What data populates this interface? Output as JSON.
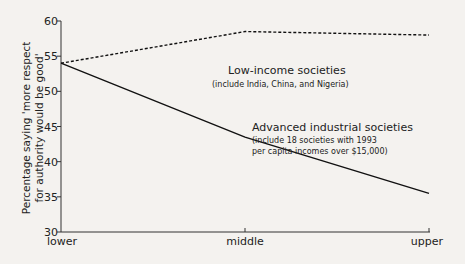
{
  "chart_data": {
    "type": "line",
    "title": "",
    "xlabel": "",
    "ylabel": "Percentage saying 'more respect for authority would be good'",
    "ylabel_lines": [
      "Percentage saying 'more respect",
      "for authority would be good'"
    ],
    "categories": [
      "lower",
      "middle",
      "upper"
    ],
    "ylim": [
      30,
      60
    ],
    "yticks": [
      30,
      35,
      40,
      45,
      50,
      55,
      60
    ],
    "grid": false,
    "series": [
      {
        "name": "Low-income societies",
        "style": "dashed",
        "values": [
          54,
          58.5,
          58
        ]
      },
      {
        "name": "Advanced industrial societies",
        "style": "solid",
        "values": [
          54,
          43.5,
          35.5
        ]
      }
    ],
    "annotations": [
      {
        "series": "Low-income societies",
        "title": "Low-income societies",
        "note": "(include India, China, and Nigeria)"
      },
      {
        "series": "Advanced industrial societies",
        "title": "Advanced industrial societies",
        "note_lines": [
          "(include 18 societies with 1993",
          "per capita incomes over $15,000)"
        ]
      }
    ]
  }
}
